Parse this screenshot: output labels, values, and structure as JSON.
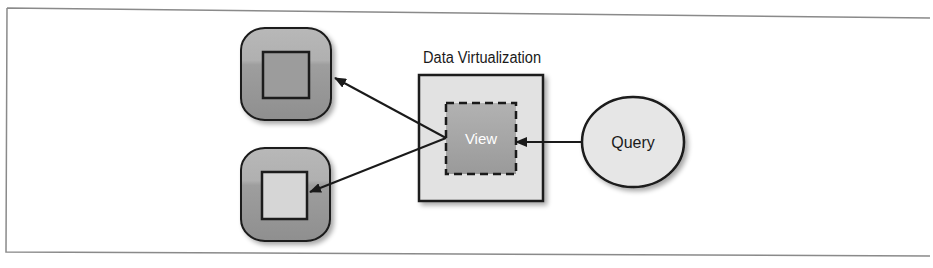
{
  "diagram": {
    "title": "Data Virtualization",
    "view_label": "View",
    "query_label": "Query",
    "nodes": [
      {
        "id": "source-db-1",
        "kind": "database-cylinder",
        "inner_square": "dark"
      },
      {
        "id": "source-db-2",
        "kind": "database-cylinder",
        "inner_square": "light"
      },
      {
        "id": "data-virtualization-layer",
        "kind": "box",
        "label": "Data Virtualization"
      },
      {
        "id": "view",
        "kind": "dashed-box",
        "label": "View"
      },
      {
        "id": "query",
        "kind": "ellipse",
        "label": "Query"
      }
    ],
    "edges": [
      {
        "from": "query",
        "to": "view"
      },
      {
        "from": "view",
        "to": "source-db-1"
      },
      {
        "from": "view",
        "to": "source-db-2"
      }
    ],
    "colors": {
      "cylinder_fill": "#a3a3a3",
      "cylinder_top": "#b5b5b5",
      "inner_square_dark": "#9c9c9c",
      "inner_square_light": "#d6d6d6",
      "layer_fill": "#e2e2e2",
      "view_fill": "#a8a8a8",
      "query_fill": "#e6e6e6",
      "stroke": "#1a1a1a",
      "frame": "#8a8a8a"
    }
  }
}
